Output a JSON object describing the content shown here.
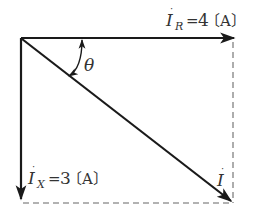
{
  "diagram": {
    "type": "phasor-diagram",
    "angle_label": "θ",
    "vectors": [
      {
        "id": "IR",
        "symbol": "I",
        "subscript": "R",
        "equals": "=",
        "value": "4",
        "unit": "〔A〕",
        "direction": "right"
      },
      {
        "id": "IX",
        "symbol": "I",
        "subscript": "X",
        "equals": "=",
        "value": "3",
        "unit": "〔A〕",
        "direction": "down"
      },
      {
        "id": "I",
        "symbol": "I",
        "subscript": "",
        "direction": "diagonal"
      }
    ],
    "colors": {
      "line": "#1a1a1a",
      "dashed": "#999999",
      "text": "#333333"
    }
  }
}
